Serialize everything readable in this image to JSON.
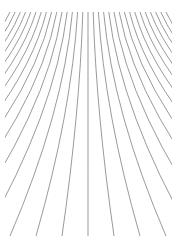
{
  "figure": {
    "background": "#ffffff",
    "stroke_color": "#6e6e6e",
    "stroke_width": 0.7,
    "line_count": 31,
    "top_y": 12,
    "top_x_start": 10,
    "top_x_end": 166,
    "center_x": 88,
    "bottom_y": 236,
    "bottom_spacing": 26,
    "clip": {
      "x": 5,
      "y": 10,
      "width": 167,
      "height": 232
    }
  }
}
